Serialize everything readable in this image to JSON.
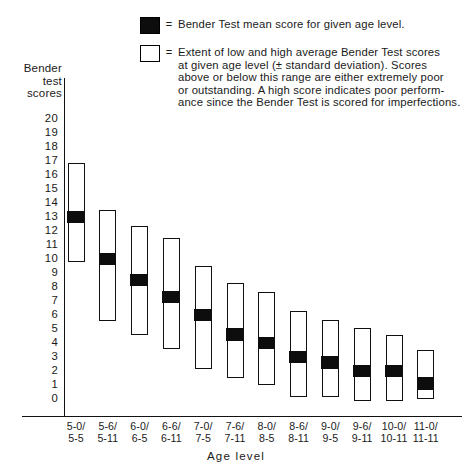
{
  "legend": {
    "items": [
      {
        "swatch": "filled-black-square",
        "equals": "=",
        "lines": [
          "Bender Test mean score for given age level."
        ]
      },
      {
        "swatch": "open-white-square",
        "equals": "=",
        "lines": [
          "Extent of low and high average Bender Test scores",
          "at given age level (± standard deviation). Scores",
          "above or below this range are either extremely poor",
          "or outstanding. A high score indicates poor perform-",
          "ance since the Bender Test is scored for imperfections."
        ]
      }
    ]
  },
  "axes": {
    "y_title_lines": [
      "Bender",
      "test",
      "scores"
    ],
    "x_title": "Age level"
  },
  "chart_data": {
    "type": "bar",
    "title": "",
    "subtitle": "",
    "xlabel": "Age level",
    "ylabel": "Bender test scores",
    "ylim": [
      0,
      20
    ],
    "yticks": [
      20,
      19,
      18,
      17,
      16,
      15,
      14,
      13,
      12,
      11,
      10,
      9,
      8,
      7,
      6,
      5,
      4,
      3,
      2,
      1,
      0
    ],
    "grid": false,
    "legend_position": "top",
    "categories": [
      "5-0/\n5-5",
      "5-6/\n5-11",
      "6-0/\n6-5",
      "6-6/\n6-11",
      "7-0/\n7-5",
      "7-6/\n7-11",
      "8-0/\n8-5",
      "8-6/\n8-11",
      "9-0/\n9-5",
      "9-6/\n9-11",
      "10-0/\n10-11",
      "11-0/\n11-11"
    ],
    "category_lines": [
      [
        "5-0/",
        "5-5"
      ],
      [
        "5-6/",
        "5-11"
      ],
      [
        "6-0/",
        "6-5"
      ],
      [
        "6-6/",
        "6-11"
      ],
      [
        "7-0/",
        "7-5"
      ],
      [
        "7-6/",
        "7-11"
      ],
      [
        "8-0/",
        "8-5"
      ],
      [
        "8-6/",
        "8-11"
      ],
      [
        "9-0/",
        "9-5"
      ],
      [
        "9-6/",
        "9-11"
      ],
      [
        "10-0/",
        "10-11"
      ],
      [
        "11-0/",
        "11-11"
      ]
    ],
    "series": [
      {
        "name": "Extent of low and high average Bender Test scores (±1 SD)",
        "type": "range",
        "low": [
          9.7,
          5.5,
          4.5,
          3.5,
          2.1,
          1.4,
          0.9,
          0.1,
          0.1,
          -0.2,
          -0.2,
          -0.1
        ],
        "high": [
          16.8,
          13.4,
          12.3,
          11.4,
          9.4,
          8.2,
          7.6,
          6.2,
          5.6,
          5.0,
          4.5,
          3.4
        ]
      },
      {
        "name": "Bender Test mean score for given age level",
        "type": "marker",
        "values": [
          13.0,
          10.0,
          8.5,
          7.3,
          6.0,
          4.6,
          4.0,
          3.0,
          2.6,
          2.0,
          2.0,
          1.1
        ]
      }
    ]
  },
  "colors": {
    "mean_marker": "#0d0d0d",
    "range_outline": "#101010",
    "range_fill": "#ffffff",
    "background": "#ffffff",
    "axis": "#111111"
  }
}
